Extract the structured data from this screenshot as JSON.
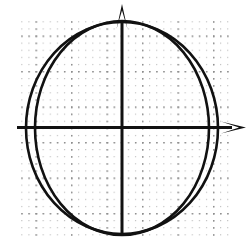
{
  "figure": {
    "width": 250,
    "height": 246,
    "background_color": "#ffffff"
  },
  "chart_data": {
    "type": "scatter",
    "title": "",
    "subtitle": "",
    "xlabel": "",
    "ylabel": "",
    "tick_labels_x": [],
    "tick_labels_y": [],
    "legend": [],
    "legend_position": "none",
    "grid": true,
    "grid_style": "dotted",
    "grid_color": "#b9b9b9",
    "grid_major_spacing_px": 35.5,
    "grid_minor_spacing_px": 7.1,
    "grid_bounds_px": {
      "x0": 17,
      "y0": 19,
      "x1": 232,
      "y1": 236
    },
    "axes": {
      "color": "#111111",
      "stroke_width_px": 3,
      "origin_px": {
        "x": 122,
        "y": 127.5
      },
      "x_axis": {
        "name": "x-axis",
        "from_px": {
          "x": 17,
          "y": 127.5
        },
        "to_px": {
          "x": 232,
          "y": 127.5
        },
        "arrow": "right",
        "arrow_tip_px": {
          "x": 246,
          "y": 127.5
        }
      },
      "y_axis": {
        "name": "y-axis",
        "from_px": {
          "x": 122,
          "y": 236
        },
        "to_px": {
          "x": 122,
          "y": 20
        },
        "arrow": "up",
        "arrow_tip_px": {
          "x": 122,
          "y": 4
        }
      }
    },
    "curves": [
      {
        "name": "ellipse-outer-wide",
        "shape": "ellipse",
        "center_px": {
          "x": 122,
          "y": 128
        },
        "rx_px": 96,
        "ry_px": 106,
        "rotation_deg": 0,
        "stroke_color": "#111111",
        "stroke_width_px": 2.6,
        "fill": "none",
        "x_axis_intercepts_px": [
          26,
          218
        ],
        "y_axis_intercepts_px": [
          22,
          234
        ]
      },
      {
        "name": "ellipse-inner-tall",
        "shape": "ellipse",
        "center_px": {
          "x": 122,
          "y": 128
        },
        "rx_px": 87,
        "ry_px": 107,
        "rotation_deg": 0,
        "stroke_color": "#111111",
        "stroke_width_px": 2.6,
        "fill": "none",
        "x_axis_intercepts_px": [
          35,
          209
        ],
        "y_axis_intercepts_px": [
          21,
          235
        ]
      }
    ]
  }
}
